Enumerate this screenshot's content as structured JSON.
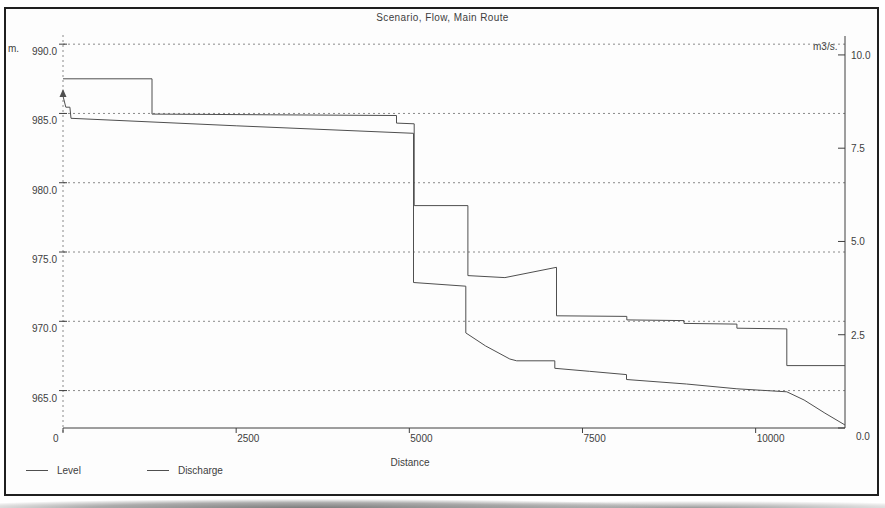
{
  "title": "Scenario, Flow, Main Route",
  "colors": {
    "line": "#4f4f4f",
    "grid": "#8a8a8a",
    "axis": "#3f3f3f",
    "text": "#3d3d3d",
    "border": "#1f1f1f",
    "background": "#fdfdfd"
  },
  "axes": {
    "left": {
      "unit_label": "m.",
      "ticks": [
        "990.0",
        "985.0",
        "980.0",
        "975.0",
        "970.0",
        "965.0"
      ],
      "tick_values": [
        990,
        985,
        980,
        975,
        970,
        965
      ]
    },
    "right": {
      "unit_label": "m3/s.",
      "ticks": [
        "10.0",
        "7.5",
        "5.0",
        "2.5",
        "0.0"
      ],
      "tick_values": [
        10,
        7.5,
        5,
        2.5,
        0
      ]
    },
    "x": {
      "title": "Distance",
      "ticks": [
        "0",
        "2500",
        "5000",
        "7500",
        "10000"
      ],
      "tick_values": [
        0,
        2500,
        5000,
        7500,
        10000
      ]
    }
  },
  "legend": [
    {
      "label": "Level"
    },
    {
      "label": "Discharge"
    }
  ],
  "chart_data": {
    "type": "line",
    "title": "Scenario, Flow, Main Route",
    "xlabel": "Distance",
    "x_range": [
      0,
      11290
    ],
    "grid": "dashed-horizontal",
    "legend_position": "bottom-left",
    "left_axis": {
      "label": "m.",
      "range": [
        962.3,
        990.3
      ]
    },
    "right_axis": {
      "label": "m3/s.",
      "range": [
        0,
        10.4
      ]
    },
    "series": [
      {
        "name": "Level",
        "axis": "left",
        "points": [
          [
            0,
            987.5
          ],
          [
            1285,
            987.5
          ],
          [
            1285,
            984.95
          ],
          [
            3000,
            984.9
          ],
          [
            4815,
            984.85
          ],
          [
            4815,
            984.3
          ],
          [
            5070,
            984.25
          ],
          [
            5070,
            978.35
          ],
          [
            5845,
            978.35
          ],
          [
            5845,
            973.3
          ],
          [
            6380,
            973.15
          ],
          [
            7125,
            973.9
          ],
          [
            7125,
            970.4
          ],
          [
            8140,
            970.35
          ],
          [
            8140,
            970.1
          ],
          [
            8965,
            970.05
          ],
          [
            8965,
            969.85
          ],
          [
            9730,
            969.8
          ],
          [
            9730,
            969.5
          ],
          [
            10450,
            969.45
          ],
          [
            10450,
            966.8
          ],
          [
            11290,
            966.8
          ]
        ]
      },
      {
        "name": "Discharge",
        "axis": "right",
        "points": [
          [
            0,
            8.9
          ],
          [
            40,
            8.6
          ],
          [
            100,
            8.6
          ],
          [
            115,
            8.3
          ],
          [
            2500,
            8.1
          ],
          [
            5060,
            7.9
          ],
          [
            5060,
            3.9
          ],
          [
            5815,
            3.8
          ],
          [
            5815,
            2.55
          ],
          [
            6100,
            2.2
          ],
          [
            6450,
            1.85
          ],
          [
            6550,
            1.8
          ],
          [
            7100,
            1.8
          ],
          [
            7100,
            1.6
          ],
          [
            7600,
            1.52
          ],
          [
            8135,
            1.43
          ],
          [
            8135,
            1.3
          ],
          [
            9000,
            1.18
          ],
          [
            9730,
            1.05
          ],
          [
            10450,
            0.97
          ],
          [
            10700,
            0.75
          ],
          [
            11000,
            0.4
          ],
          [
            11290,
            0.08
          ]
        ]
      }
    ]
  }
}
